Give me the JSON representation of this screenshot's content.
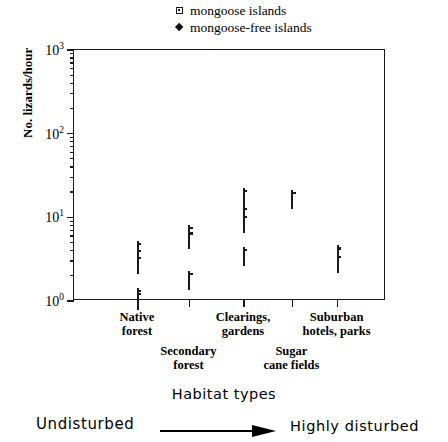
{
  "legend": {
    "items": [
      {
        "label": "mongoose islands",
        "marker": "open-square-icon"
      },
      {
        "label": "mongoose-free islands",
        "marker": "filled-diamond-icon"
      }
    ]
  },
  "axes": {
    "y": {
      "label": "No. lizards/hour",
      "scale": "log",
      "ticks": [
        "10",
        "10",
        "10",
        "10"
      ],
      "tick_exponents": [
        "0",
        "1",
        "2",
        "3"
      ],
      "tick_values": [
        1,
        10,
        100,
        1000
      ]
    },
    "x": {
      "categories": [
        "Native\nforest",
        "Secondary\nforest",
        "Clearings,\ngardens",
        "Sugar\ncane fields",
        "Suburban\nhotels, parks"
      ]
    }
  },
  "caption": {
    "title": "Habitat   types",
    "left_end": "Undisturbed",
    "right_end": "Highly   disturbed",
    "arrow": "right-arrow-icon"
  },
  "chart_data": {
    "type": "scatter",
    "title": "",
    "xlabel": "Habitat types",
    "ylabel": "No. lizards/hour",
    "yscale": "log",
    "ylim": [
      1,
      1000
    ],
    "grid": false,
    "legend_position": "top-center",
    "categories": [
      "Native forest",
      "Secondary forest",
      "Clearings, gardens",
      "Sugar cane fields",
      "Suburban hotels, parks"
    ],
    "series": [
      {
        "name": "mongoose islands",
        "marker": "open square",
        "points": [
          {
            "category": "Native forest",
            "x": 1,
            "y": 4.0
          },
          {
            "category": "Native forest",
            "x": 1,
            "y": 3.3
          },
          {
            "category": "Native forest",
            "x": 1,
            "y": 2.7
          },
          {
            "category": "Native forest",
            "x": 1,
            "y": 1.08
          },
          {
            "category": "Native forest",
            "x": 1,
            "y": 1.0
          },
          {
            "category": "Secondary forest",
            "x": 2,
            "y": 6.2
          },
          {
            "category": "Secondary forest",
            "x": 2,
            "y": 5.3
          },
          {
            "category": "Secondary forest",
            "x": 2,
            "y": 1.75
          },
          {
            "category": "Clearings, gardens",
            "x": 3,
            "y": 17.0
          },
          {
            "category": "Clearings, gardens",
            "x": 3,
            "y": 10.5
          },
          {
            "category": "Clearings, gardens",
            "x": 3,
            "y": 8.4
          },
          {
            "category": "Clearings, gardens",
            "x": 3,
            "y": 3.4
          },
          {
            "category": "Sugar cane fields",
            "x": 4,
            "y": 16.0
          },
          {
            "category": "Suburban hotels, parks",
            "x": 5,
            "y": 3.5
          },
          {
            "category": "Suburban hotels, parks",
            "x": 5,
            "y": 2.8
          }
        ]
      },
      {
        "name": "mongoose-free islands",
        "marker": "filled diamond",
        "points": [
          {
            "category": "Native forest",
            "x": 1,
            "y": 13.0
          },
          {
            "category": "Native forest",
            "x": 1,
            "y": 9.6
          },
          {
            "category": "Native forest",
            "x": 1,
            "y": 8.8
          },
          {
            "category": "Native forest",
            "x": 1,
            "y": 8.0
          },
          {
            "category": "Native forest",
            "x": 1,
            "y": 7.3
          },
          {
            "category": "Native forest",
            "x": 1,
            "y": 6.6
          },
          {
            "category": "Native forest",
            "x": 1,
            "y": 4.6
          },
          {
            "category": "Native forest",
            "x": 1,
            "y": 3.0
          },
          {
            "category": "Secondary forest",
            "x": 2,
            "y": 40.0
          },
          {
            "category": "Secondary forest",
            "x": 2,
            "y": 21.0
          },
          {
            "category": "Secondary forest",
            "x": 2,
            "y": 16.5
          },
          {
            "category": "Secondary forest",
            "x": 2,
            "y": 15.0
          },
          {
            "category": "Secondary forest",
            "x": 2,
            "y": 10.0
          },
          {
            "category": "Clearings, gardens",
            "x": 3,
            "y": 110.0
          },
          {
            "category": "Clearings, gardens",
            "x": 3,
            "y": 98.0
          },
          {
            "category": "Clearings, gardens",
            "x": 3,
            "y": 88.0
          },
          {
            "category": "Clearings, gardens",
            "x": 3,
            "y": 60.0
          },
          {
            "category": "Clearings, gardens",
            "x": 3,
            "y": 38.0
          },
          {
            "category": "Clearings, gardens",
            "x": 3,
            "y": 22.0
          },
          {
            "category": "Clearings, gardens",
            "x": 3,
            "y": 14.5
          },
          {
            "category": "Sugar cane fields",
            "x": 4,
            "y": 85.0
          },
          {
            "category": "Sugar cane fields",
            "x": 4,
            "y": 20.0
          },
          {
            "category": "Suburban hotels, parks",
            "x": 5,
            "y": 15.0
          },
          {
            "category": "Suburban hotels, parks",
            "x": 5,
            "y": 12.5
          },
          {
            "category": "Suburban hotels, parks",
            "x": 5,
            "y": 11.5
          }
        ]
      }
    ]
  }
}
